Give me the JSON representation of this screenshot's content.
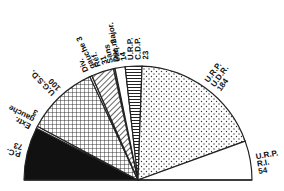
{
  "chart_data": {
    "type": "pie",
    "subtype": "semicircle-parliament",
    "title": "",
    "total": 487,
    "categories": [
      "P.C.",
      "Extr. gauche",
      "U.G.S.D.",
      "Div. gauche",
      "Réf.",
      "Sans étiq.",
      "Div. major.",
      "U.R.P. C.D.P.",
      "U.R.P. U.D.R.",
      "U.R.P. R.I."
    ],
    "values": [
      73,
      3,
      100,
      3,
      31,
      2,
      14,
      23,
      184,
      54
    ],
    "slices": [
      {
        "label": "P.C.",
        "value": 73,
        "pattern": "solid-black",
        "label_lines": [
          "P.C.",
          "73"
        ]
      },
      {
        "label": "Extr. gauche",
        "value": 3,
        "pattern": "white",
        "label_lines": [
          "Extr.",
          "gauche",
          "3"
        ]
      },
      {
        "label": "U.G.S.D.",
        "value": 100,
        "pattern": "crosshatch",
        "label_lines": [
          "U.G.S.D.",
          "100"
        ]
      },
      {
        "label": "Div. gauche",
        "value": 3,
        "pattern": "white",
        "label_lines": [
          "Div.",
          "gauche 3"
        ]
      },
      {
        "label": "Réf.",
        "value": 31,
        "pattern": "diagonal-hatch",
        "label_lines": [
          "Réf.",
          "31"
        ]
      },
      {
        "label": "Sans étiq.",
        "value": 2,
        "pattern": "white",
        "label_lines": [
          "Sans",
          "étiq. 2"
        ]
      },
      {
        "label": "Div. major.",
        "value": 14,
        "pattern": "white",
        "label_lines": [
          "Div. major.",
          "14"
        ]
      },
      {
        "label": "U.R.P. C.D.P.",
        "value": 23,
        "pattern": "horizontal-lines",
        "label_lines": [
          "U.R.P.",
          "C.D.P.",
          "23"
        ]
      },
      {
        "label": "U.R.P. U.D.R.",
        "value": 184,
        "pattern": "dots",
        "label_lines": [
          "U.R.P.",
          "U.D.R.",
          "184"
        ]
      },
      {
        "label": "U.R.P. R.I.",
        "value": 54,
        "pattern": "white",
        "label_lines": [
          "U.R.P.",
          "R.I.",
          "54"
        ]
      }
    ],
    "legend": "none (labels placed around arc)"
  }
}
